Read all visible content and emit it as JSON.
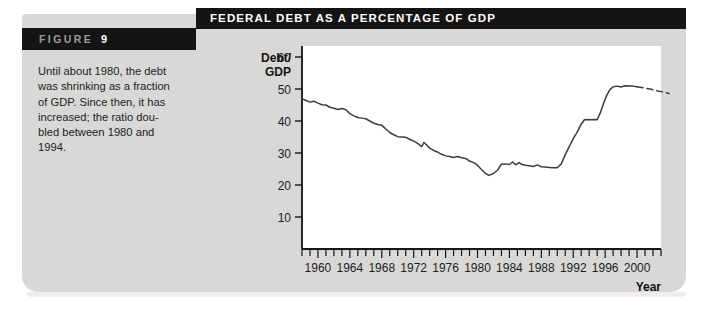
{
  "figure": {
    "label_word": "FIGURE",
    "label_number": "9",
    "caption_lines": [
      "Until about 1980, the debt",
      "was shrinking as a fraction",
      "of GDP. Since then, it has",
      "increased; the ratio dou-",
      "bled between 1980 and",
      "1994."
    ]
  },
  "colors": {
    "card_background": "#d8d8d6",
    "title_bar": "#141414",
    "plot_background": "#ffffff",
    "line": "#3d3d3d",
    "text": "#1d1d1d"
  },
  "chart_data": {
    "type": "line",
    "title": "FEDERAL DEBT AS A PERCENTAGE OF GDP",
    "xlabel": "Year",
    "ylabel": "Debt/ GDP",
    "ylabel_lines": [
      "Debt/",
      "GDP"
    ],
    "xlim": [
      1958,
      2003
    ],
    "ylim": [
      0,
      62
    ],
    "yticks": [
      10,
      20,
      30,
      40,
      50,
      60
    ],
    "ytick_labels": [
      "10",
      "20",
      "30",
      "40",
      "50",
      "60"
    ],
    "xticks": [
      1960,
      1964,
      1968,
      1972,
      1976,
      1980,
      1984,
      1988,
      1992,
      1996,
      2000
    ],
    "xtick_labels": [
      "1960",
      "1964",
      "1968",
      "1972",
      "1976",
      "1980",
      "1984",
      "1988",
      "1992",
      "1996",
      "2000"
    ],
    "x_minor_tick_step": 1,
    "x_minor_tick_range": [
      1958,
      2003
    ],
    "grid": false,
    "legend": false,
    "series": [
      {
        "name": "Federal debt as a percentage of GDP (actual)",
        "style": "solid",
        "x": [
          1958,
          1959,
          1960,
          1961,
          1962,
          1963,
          1964,
          1965,
          1966,
          1967,
          1968,
          1969,
          1970,
          1971,
          1972,
          1973,
          1974,
          1975,
          1976,
          1977,
          1978,
          1979,
          1980,
          1981,
          1982,
          1983,
          1984,
          1985,
          1986,
          1987,
          1988,
          1989,
          1990,
          1991,
          1992,
          1993,
          1994
        ],
        "values": [
          47.0,
          46.0,
          45.6,
          45.0,
          43.7,
          43.9,
          42.4,
          41.0,
          40.6,
          39.5,
          38.6,
          36.3,
          35.2,
          34.8,
          33.6,
          32.0,
          33.2,
          30.4,
          29.0,
          28.6,
          28.5,
          27.6,
          28.2,
          27.5,
          25.3,
          23.0,
          24.3,
          26.4,
          26.6,
          27.0,
          26.2,
          26.1,
          25.8,
          25.5,
          25.4,
          25.3,
          29.5
        ],
        "values_note": "values read from the plotted curve",
        "actual_series_full": [
          47.0,
          46.1,
          45.6,
          45.0,
          44.0,
          43.9,
          42.3,
          41.1,
          40.7,
          39.3,
          38.7,
          36.4,
          35.1,
          34.9,
          33.7,
          32.0,
          33.3,
          30.3,
          29.1,
          28.6,
          28.5,
          27.5,
          28.2,
          27.4,
          25.4,
          23.0,
          24.3,
          26.5,
          26.5,
          27.0,
          26.2,
          26.0,
          25.8,
          25.5,
          25.3,
          25.4,
          29.4
        ]
      },
      {
        "name": "Federal debt as a percentage of GDP (projected)",
        "style": "dashed",
        "x": [
          1995,
          1996,
          1997,
          1998,
          1999,
          2000,
          2001,
          2002,
          2003
        ],
        "values": [
          50.9,
          50.8,
          50.6,
          50.4,
          50.1,
          49.7,
          49.3,
          48.9,
          48.5
        ]
      }
    ],
    "curve_points": [
      [
        1958,
        47.0
      ],
      [
        1958.5,
        46.4
      ],
      [
        1959,
        45.9
      ],
      [
        1959.5,
        46.2
      ],
      [
        1960,
        45.6
      ],
      [
        1960.5,
        45.1
      ],
      [
        1961,
        45.0
      ],
      [
        1961.5,
        44.3
      ],
      [
        1962,
        44.0
      ],
      [
        1962.5,
        43.6
      ],
      [
        1963,
        43.9
      ],
      [
        1963.5,
        43.5
      ],
      [
        1964,
        42.3
      ],
      [
        1964.5,
        41.6
      ],
      [
        1965,
        41.1
      ],
      [
        1965.5,
        40.9
      ],
      [
        1966,
        40.7
      ],
      [
        1966.5,
        40.0
      ],
      [
        1967,
        39.3
      ],
      [
        1967.5,
        38.9
      ],
      [
        1968,
        38.7
      ],
      [
        1968.5,
        37.5
      ],
      [
        1969,
        36.4
      ],
      [
        1969.5,
        35.7
      ],
      [
        1970,
        35.1
      ],
      [
        1970.5,
        35.0
      ],
      [
        1971,
        34.9
      ],
      [
        1971.5,
        34.3
      ],
      [
        1972,
        33.7
      ],
      [
        1972.5,
        33.0
      ],
      [
        1973,
        32.0
      ],
      [
        1973.3,
        33.3
      ],
      [
        1973.6,
        32.6
      ],
      [
        1974,
        31.5
      ],
      [
        1974.5,
        30.8
      ],
      [
        1975,
        30.3
      ],
      [
        1975.5,
        29.6
      ],
      [
        1976,
        29.1
      ],
      [
        1976.5,
        28.9
      ],
      [
        1977,
        28.6
      ],
      [
        1977.5,
        28.9
      ],
      [
        1978,
        28.5
      ],
      [
        1978.5,
        28.3
      ],
      [
        1979,
        27.5
      ],
      [
        1979.5,
        27.0
      ],
      [
        1980,
        26.2
      ],
      [
        1980.4,
        25.1
      ],
      [
        1981,
        23.6
      ],
      [
        1981.4,
        23.0
      ],
      [
        1982,
        23.6
      ],
      [
        1982.5,
        24.6
      ],
      [
        1983,
        26.5
      ],
      [
        1983.5,
        26.6
      ],
      [
        1984,
        26.4
      ],
      [
        1984.4,
        27.2
      ],
      [
        1984.8,
        26.3
      ],
      [
        1985.2,
        27.0
      ],
      [
        1985.6,
        26.4
      ],
      [
        1986,
        26.2
      ],
      [
        1986.5,
        26.0
      ],
      [
        1987,
        25.8
      ],
      [
        1987.5,
        26.3
      ],
      [
        1988,
        25.7
      ],
      [
        1988.5,
        25.6
      ],
      [
        1989,
        25.5
      ],
      [
        1989.5,
        25.4
      ],
      [
        1990,
        25.4
      ],
      [
        1990.5,
        26.6
      ],
      [
        1991,
        29.5
      ],
      [
        1991.5,
        32.0
      ],
      [
        1992,
        34.5
      ],
      [
        1992.5,
        36.5
      ],
      [
        1993,
        39.0
      ],
      [
        1993.4,
        40.4
      ],
      [
        1993.8,
        40.5
      ],
      [
        1994.2,
        40.4
      ],
      [
        1994.6,
        40.5
      ],
      [
        1995,
        40.4
      ],
      [
        1995.4,
        42.6
      ],
      [
        1995.8,
        45.5
      ],
      [
        1996.2,
        48.0
      ],
      [
        1996.6,
        49.8
      ],
      [
        1997,
        50.7
      ],
      [
        1997.5,
        50.9
      ],
      [
        1998,
        50.6
      ],
      [
        1998.5,
        51.0
      ],
      [
        1999,
        50.9
      ],
      [
        1999.5,
        50.9
      ],
      [
        2000,
        50.7
      ]
    ],
    "dashed_points": [
      [
        2000,
        50.7
      ],
      [
        2000.8,
        50.4
      ],
      [
        2001.6,
        50.0
      ],
      [
        2002.4,
        49.5
      ],
      [
        2003.2,
        49.1
      ],
      [
        2004,
        48.6
      ]
    ]
  }
}
